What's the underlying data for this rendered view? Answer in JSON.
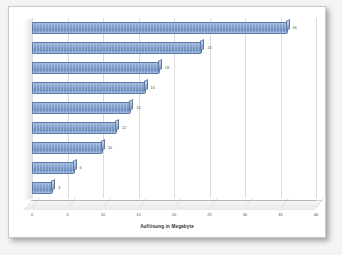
{
  "chart_data": {
    "type": "bar",
    "orientation": "horizontal",
    "title": "",
    "xlabel": "Auflösung in Megabyte",
    "ylabel": "",
    "xlim": [
      0,
      40
    ],
    "xticks": [
      0,
      5,
      10,
      15,
      20,
      25,
      30,
      35,
      40
    ],
    "xticklabels": [
      "0",
      "5",
      "10",
      "15",
      "20",
      "25",
      "30",
      "35",
      "40"
    ],
    "grid": "vertical",
    "legend": "none",
    "categories": [
      "",
      "",
      "",
      "",
      "",
      "",
      "",
      "",
      ""
    ],
    "values": [
      36,
      24,
      18,
      16,
      14,
      12,
      10,
      6,
      3
    ],
    "data_labels": [
      "36",
      "24",
      "18",
      "16",
      "14",
      "12",
      "10",
      "6",
      "3"
    ],
    "series": [
      {
        "name": "Auflösung",
        "values": [
          36,
          24,
          18,
          16,
          14,
          12,
          10,
          6,
          3
        ]
      }
    ],
    "style": {
      "bar_color": "#7d9cc9",
      "bar_border": "#5b7aa8",
      "gridline_color": "#dcdcdc",
      "axis_color": "#b6b6b6",
      "plot_background": "#ffffff",
      "page_background": "#ffffff",
      "three_d": true
    }
  }
}
